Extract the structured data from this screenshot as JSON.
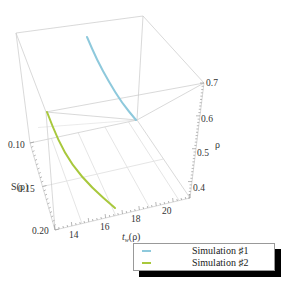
{
  "chart_data": {
    "type": "line",
    "projection": "3d",
    "title": "",
    "axes": {
      "x": {
        "label": "t_w(ρ)",
        "label_main": "t",
        "label_sub": "w",
        "label_suffix": "(ρ)",
        "ticks": [
          14,
          16,
          18,
          20
        ],
        "range": [
          13,
          21
        ]
      },
      "y": {
        "label": "S(ρ)",
        "ticks": [
          0.1,
          0.15,
          0.2
        ],
        "tick_labels": [
          "0.10",
          "0.15",
          "0.20"
        ],
        "range": [
          0.1,
          0.2
        ]
      },
      "z": {
        "label": "ρ",
        "ticks": [
          0.4,
          0.5,
          0.6,
          0.7
        ],
        "tick_labels": [
          "0.4",
          "0.5",
          "0.6",
          "0.7"
        ],
        "range": [
          0.35,
          0.7
        ]
      }
    },
    "series": [
      {
        "name": "Simulation #1",
        "color": "#8ec9dc",
        "points": [
          {
            "t": 17.0,
            "S": 0.1,
            "rho": 0.7
          },
          {
            "t": 17.6,
            "S": 0.1,
            "rho": 0.64
          },
          {
            "t": 18.4,
            "S": 0.1,
            "rho": 0.56
          },
          {
            "t": 19.3,
            "S": 0.1,
            "rho": 0.48
          },
          {
            "t": 20.4,
            "S": 0.1,
            "rho": 0.4
          }
        ]
      },
      {
        "name": "Simulation #2",
        "color": "#a8c83c",
        "points": [
          {
            "t": 13.2,
            "S": 0.1,
            "rho": 0.4
          },
          {
            "t": 13.6,
            "S": 0.12,
            "rho": 0.4
          },
          {
            "t": 14.3,
            "S": 0.145,
            "rho": 0.4
          },
          {
            "t": 15.3,
            "S": 0.17,
            "rho": 0.4
          },
          {
            "t": 16.6,
            "S": 0.195,
            "rho": 0.4
          }
        ]
      }
    ],
    "legend": {
      "position": "bottom-right",
      "entries": [
        "Simulation ♯1",
        "Simulation ♯2"
      ]
    },
    "grid": true,
    "box_color": "#c8c8c8",
    "grid_color": "#e2e2e2"
  }
}
